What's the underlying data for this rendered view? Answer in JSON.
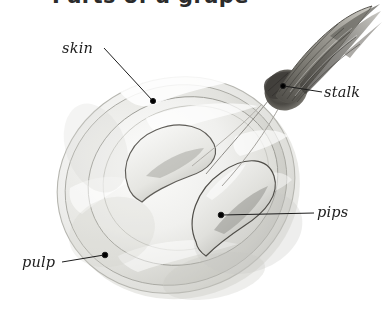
{
  "figure": {
    "title_partial": "Parts of a grape",
    "title_note": "cut off at top edge of image",
    "background_color": "#ffffff",
    "ink_color": "#1c1c1c"
  },
  "labels": {
    "skin": {
      "text": "skin",
      "leader": "diagonal line down-right to dot on outer rim"
    },
    "stalk": {
      "text": "stalk",
      "leader": "horizontal line left to dot on stalk base"
    },
    "pips": {
      "text": "pips",
      "leader": "horizontal line left to dot on lower seed"
    },
    "pulp": {
      "text": "pulp",
      "leader": "horizontal line right to dot on flesh"
    }
  },
  "icon_names": [
    "leader-line-skin",
    "leader-line-stalk",
    "leader-line-pips",
    "leader-line-pulp",
    "leader-dot"
  ],
  "palette": {
    "skin_fill": "#e9e9e7",
    "skin_rim": "#cfcfca",
    "flesh_fill": "#f1f1ef",
    "flesh_shadow": "#c9c9c4",
    "pip_fill": "#e4e4e0",
    "pip_shadow": "#a9a9a3",
    "stalk_dark": "#55534e",
    "stalk_mid": "#8e8c85",
    "highlight": "#ffffff",
    "outline": "#6f6d68"
  }
}
